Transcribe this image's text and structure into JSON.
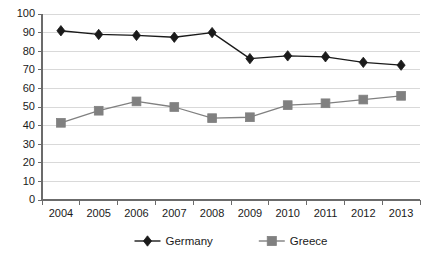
{
  "chart_data": {
    "type": "line",
    "title": "",
    "xlabel": "",
    "ylabel": "",
    "categories": [
      "2004",
      "2005",
      "2006",
      "2007",
      "2008",
      "2009",
      "2010",
      "2011",
      "2012",
      "2013"
    ],
    "series": [
      {
        "name": "Germany",
        "marker": "diamond",
        "color": "#1a1a1a",
        "values": [
          91,
          89,
          88.5,
          87.5,
          90,
          76,
          77.5,
          77,
          74,
          72.5
        ]
      },
      {
        "name": "Greece",
        "marker": "square",
        "color": "#808080",
        "values": [
          41.5,
          48,
          53,
          50,
          44,
          44.5,
          51,
          52,
          54,
          56
        ]
      }
    ],
    "ylim": [
      0,
      100
    ],
    "ytick_step": 10,
    "yticks": [
      "0",
      "10",
      "20",
      "30",
      "40",
      "50",
      "60",
      "70",
      "80",
      "90",
      "100"
    ],
    "grid": true,
    "grid_color": "#d9d9d9",
    "axis_color": "#6b6b6b",
    "legend_position": "bottom",
    "background": "#ffffff"
  },
  "legend": {
    "entries": [
      {
        "label": "Germany",
        "color": "#1a1a1a",
        "marker": "diamond"
      },
      {
        "label": "Greece",
        "color": "#808080",
        "marker": "square"
      }
    ]
  }
}
